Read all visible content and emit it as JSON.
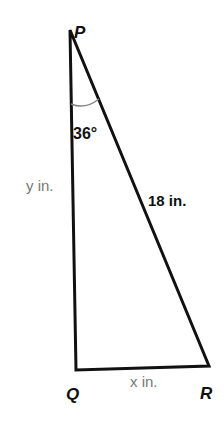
{
  "diagram": {
    "type": "right-triangle",
    "vertices": {
      "P": {
        "label": "P"
      },
      "Q": {
        "label": "Q"
      },
      "R": {
        "label": "R"
      }
    },
    "sides": {
      "PQ": {
        "label": "y in."
      },
      "QR": {
        "label": "x in."
      },
      "PR": {
        "label": "18 in."
      }
    },
    "angles": {
      "P": {
        "label": "36°"
      }
    },
    "colors": {
      "stroke": "#111111",
      "arc": "#888888",
      "muted_text": "#777777"
    }
  }
}
